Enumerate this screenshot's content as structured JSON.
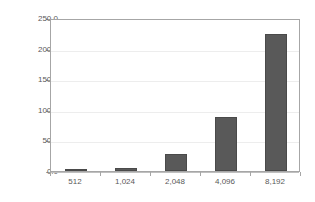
{
  "chart_data": {
    "type": "bar",
    "title": "",
    "subtitle": "",
    "xlabel": "",
    "ylabel": "",
    "categories": [
      "512",
      "1,024",
      "2,048",
      "4,096",
      "8,192"
    ],
    "values": [
      1.5,
      5,
      28,
      89,
      224
    ],
    "ylim": [
      0,
      250
    ],
    "yticks": [
      0,
      50,
      100,
      150,
      200,
      250
    ],
    "ytick_labels": [
      "0.0",
      "50.0",
      "100.0",
      "150.0",
      "200.0",
      "250.0"
    ],
    "grid": true,
    "grid_axis": "y",
    "legend": false,
    "legend_position": "none",
    "series": [
      {
        "name": "",
        "values": [
          1.5,
          5,
          28,
          89,
          224
        ]
      }
    ],
    "colors": {
      "bar_fill": "#595959",
      "bar_border": "#4a4a4a",
      "gridline": "#ededed",
      "axis_line": "#a6a6a6",
      "tick_label": "#595959",
      "plot_background": "#ffffff"
    }
  }
}
